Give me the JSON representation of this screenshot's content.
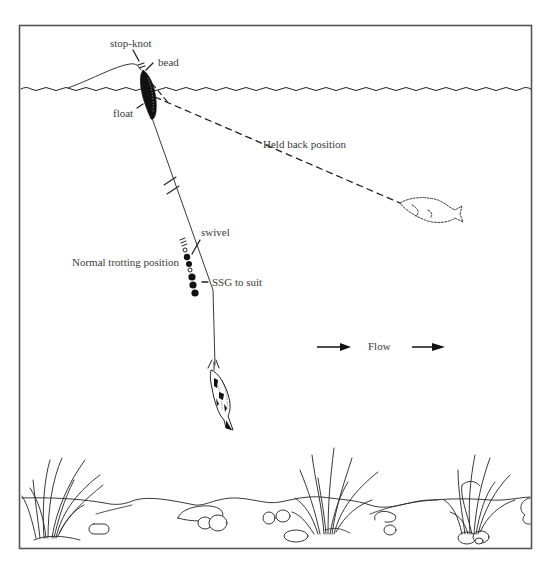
{
  "diagram": {
    "labels": {
      "stop_knot": "stop-knot",
      "bead": "bead",
      "float": "float",
      "held_back": "Held back position",
      "swivel": "swivel",
      "normal_trotting": "Normal trotting position",
      "ssg": "SSG to suit",
      "flow": "Flow"
    },
    "colors": {
      "ink": "#222222",
      "text": "#3a3a3a",
      "frame": "#555555",
      "background": "#ffffff"
    },
    "icons": {
      "flow_arrow_left": "right-arrow",
      "flow_arrow_right": "right-arrow"
    }
  }
}
